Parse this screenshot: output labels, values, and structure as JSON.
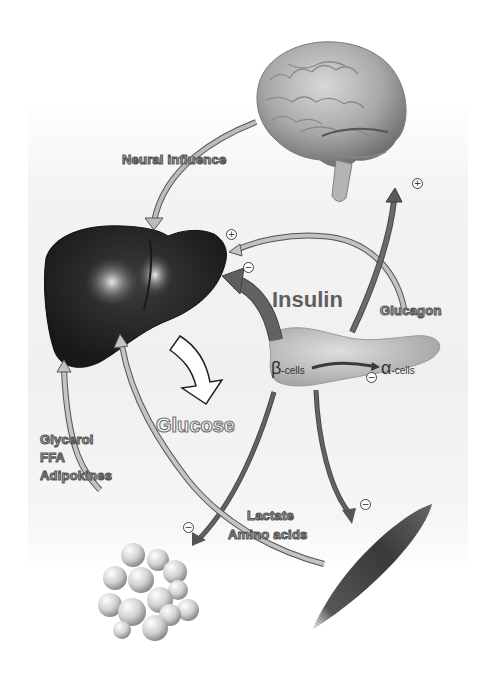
{
  "diagram": {
    "type": "glucose-regulation-organ-network",
    "nodes": [
      {
        "id": "brain",
        "label": "Brain"
      },
      {
        "id": "liver",
        "label": "Liver"
      },
      {
        "id": "pancreas",
        "label": "Pancreas"
      },
      {
        "id": "adipose",
        "label": "Adipose tissue"
      },
      {
        "id": "muscle",
        "label": "Muscle"
      }
    ],
    "labels": {
      "neural_influence": "Neural influence",
      "insulin": "Insulin",
      "glucagon": "Glucagon",
      "glucose": "Glucose",
      "glycerol": "Glycerol",
      "ffa": "FFA",
      "adipokines": "Adipokines",
      "lactate": "Lactate",
      "amino_acids": "Amino acids",
      "beta_symbol": "β",
      "beta_suffix": "-cells",
      "alpha_symbol": "α",
      "alpha_suffix": "-cells"
    },
    "signs": {
      "plus": "+",
      "minus": "−"
    },
    "edges": [
      {
        "from": "brain",
        "to": "liver",
        "label": "Neural influence"
      },
      {
        "from": "pancreas",
        "to": "liver",
        "label": "Insulin",
        "sign": "−"
      },
      {
        "from": "pancreas",
        "to": "liver",
        "label": "Glucagon",
        "sign": "+"
      },
      {
        "from": "pancreas",
        "to": "brain",
        "sign": "+"
      },
      {
        "from": "beta-cells",
        "to": "alpha-cells",
        "sign": "−"
      },
      {
        "from": "liver",
        "to": "blood",
        "label": "Glucose"
      },
      {
        "from": "pancreas",
        "to": "adipose",
        "sign": "−"
      },
      {
        "from": "pancreas",
        "to": "muscle",
        "sign": "−"
      },
      {
        "from": "adipose",
        "to": "liver",
        "label": "Glycerol / FFA / Adipokines"
      },
      {
        "from": "muscle",
        "to": "liver",
        "label": "Lactate / Amino acids"
      }
    ],
    "colors": {
      "dark_arrow": "#5a5a5a",
      "light_arrow": "#b8b8b8",
      "arrow_outline": "#555555",
      "liver": "#2a2a2a",
      "background": "#f0f0f0"
    }
  }
}
